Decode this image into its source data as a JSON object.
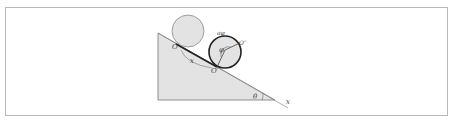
{
  "diagram": {
    "labels": {
      "origin": "O",
      "contact_point": "O′",
      "rim_point": "O″",
      "displacement": "x",
      "rotation_angle": "φ",
      "arc_length": "aφ",
      "incline_angle": "θ",
      "axis": "x"
    },
    "colors": {
      "fill": "#e3e3e3",
      "stroke": "#555555",
      "bold_stroke": "#222222",
      "frame": "#b9b9b9"
    }
  }
}
